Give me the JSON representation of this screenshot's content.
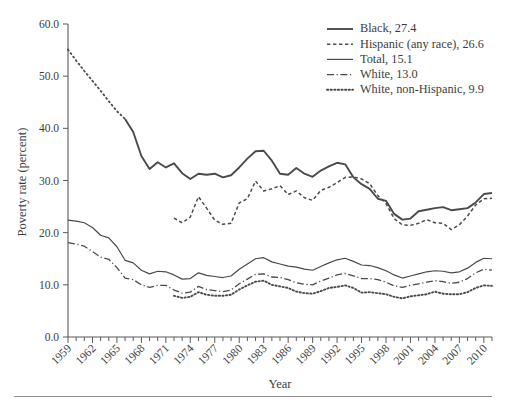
{
  "chart_data": {
    "type": "line",
    "title": "",
    "xlabel": "Year",
    "ylabel": "Poverty rate (percent)",
    "xlim": [
      1959,
      2011
    ],
    "ylim": [
      0,
      60
    ],
    "ytick_step": 10,
    "ytick_labels": [
      "0.0",
      "10.0",
      "20.0",
      "30.0",
      "40.0",
      "50.0",
      "60.0"
    ],
    "ytick_values": [
      0,
      10,
      20,
      30,
      40,
      50,
      60
    ],
    "xtick_labels": [
      "1959",
      "1962",
      "1965",
      "1968",
      "1971",
      "1974",
      "1977",
      "1980",
      "1983",
      "1986",
      "1989",
      "1992",
      "1995",
      "1998",
      "2001",
      "2004",
      "2007",
      "2010"
    ],
    "xtick_values": [
      1959,
      1962,
      1965,
      1968,
      1971,
      1974,
      1977,
      1980,
      1983,
      1986,
      1989,
      1992,
      1995,
      1998,
      2001,
      2004,
      2007,
      2010
    ],
    "minor_ticks": "every year",
    "grid": false,
    "legend_position": "top-right",
    "line_color": "#4a4a4a",
    "series": [
      {
        "name": "Black",
        "legend_label": "Black, 27.4",
        "last_value": 27.4,
        "style": "solid",
        "x": [
          1959,
          1960,
          1961,
          1962,
          1963,
          1964,
          1965,
          1966,
          1967,
          1968,
          1969,
          1970,
          1971,
          1972,
          1973,
          1974,
          1975,
          1976,
          1977,
          1978,
          1979,
          1980,
          1981,
          1982,
          1983,
          1984,
          1985,
          1986,
          1987,
          1988,
          1989,
          1990,
          1991,
          1992,
          1993,
          1994,
          1995,
          1996,
          1997,
          1998,
          1999,
          2000,
          2001,
          2002,
          2003,
          2004,
          2005,
          2006,
          2007,
          2008,
          2009,
          2010,
          2011
        ],
        "values": [
          55.1,
          53.0,
          51.0,
          49.1,
          47.2,
          45.2,
          43.3,
          41.8,
          39.3,
          34.7,
          32.2,
          33.5,
          32.5,
          33.3,
          31.4,
          30.3,
          31.3,
          31.1,
          31.3,
          30.6,
          31.0,
          32.5,
          34.2,
          35.6,
          35.7,
          33.8,
          31.3,
          31.1,
          32.4,
          31.3,
          30.7,
          31.9,
          32.7,
          33.4,
          33.1,
          30.6,
          29.3,
          28.4,
          26.5,
          26.1,
          23.6,
          22.5,
          22.7,
          24.1,
          24.4,
          24.7,
          24.9,
          24.3,
          24.5,
          24.7,
          25.8,
          27.4,
          27.6
        ]
      },
      {
        "name": "Hispanic (any race)",
        "legend_label": "Hispanic (any race), 26.6",
        "last_value": 26.6,
        "style": "dashed",
        "x": [
          1972,
          1973,
          1974,
          1975,
          1976,
          1977,
          1978,
          1979,
          1980,
          1981,
          1982,
          1983,
          1984,
          1985,
          1986,
          1987,
          1988,
          1989,
          1990,
          1991,
          1992,
          1993,
          1994,
          1995,
          1996,
          1997,
          1998,
          1999,
          2000,
          2001,
          2002,
          2003,
          2004,
          2005,
          2006,
          2007,
          2008,
          2009,
          2010,
          2011
        ],
        "values": [
          22.8,
          21.9,
          23.0,
          26.9,
          24.7,
          22.4,
          21.6,
          21.8,
          25.7,
          26.5,
          29.9,
          28.0,
          28.4,
          29.0,
          27.3,
          28.0,
          26.7,
          26.2,
          28.1,
          28.7,
          29.6,
          30.6,
          30.7,
          30.3,
          29.4,
          27.1,
          25.6,
          22.7,
          21.5,
          21.4,
          21.8,
          22.5,
          21.9,
          21.8,
          20.6,
          21.5,
          23.2,
          25.3,
          26.5,
          26.6
        ]
      },
      {
        "name": "Total",
        "legend_label": "Total, 15.1",
        "last_value": 15.1,
        "style": "solid-thin",
        "x": [
          1959,
          1960,
          1961,
          1962,
          1963,
          1964,
          1965,
          1966,
          1967,
          1968,
          1969,
          1970,
          1971,
          1972,
          1973,
          1974,
          1975,
          1976,
          1977,
          1978,
          1979,
          1980,
          1981,
          1982,
          1983,
          1984,
          1985,
          1986,
          1987,
          1988,
          1989,
          1990,
          1991,
          1992,
          1993,
          1994,
          1995,
          1996,
          1997,
          1998,
          1999,
          2000,
          2001,
          2002,
          2003,
          2004,
          2005,
          2006,
          2007,
          2008,
          2009,
          2010,
          2011
        ],
        "values": [
          22.4,
          22.2,
          21.9,
          21.0,
          19.5,
          19.0,
          17.3,
          14.7,
          14.2,
          12.8,
          12.1,
          12.6,
          12.5,
          11.9,
          11.1,
          11.2,
          12.3,
          11.8,
          11.6,
          11.4,
          11.7,
          13.0,
          14.0,
          15.0,
          15.2,
          14.4,
          14.0,
          13.6,
          13.4,
          13.0,
          12.8,
          13.5,
          14.2,
          14.8,
          15.1,
          14.5,
          13.8,
          13.7,
          13.3,
          12.7,
          11.9,
          11.3,
          11.7,
          12.1,
          12.5,
          12.7,
          12.6,
          12.3,
          12.5,
          13.2,
          14.3,
          15.1,
          15.0
        ]
      },
      {
        "name": "White",
        "legend_label": "White, 13.0",
        "last_value": 13.0,
        "style": "dash-dot",
        "x": [
          1959,
          1960,
          1961,
          1962,
          1963,
          1964,
          1965,
          1966,
          1967,
          1968,
          1969,
          1970,
          1971,
          1972,
          1973,
          1974,
          1975,
          1976,
          1977,
          1978,
          1979,
          1980,
          1981,
          1982,
          1983,
          1984,
          1985,
          1986,
          1987,
          1988,
          1989,
          1990,
          1991,
          1992,
          1993,
          1994,
          1995,
          1996,
          1997,
          1998,
          1999,
          2000,
          2001,
          2002,
          2003,
          2004,
          2005,
          2006,
          2007,
          2008,
          2009,
          2010,
          2011
        ],
        "values": [
          18.1,
          17.8,
          17.4,
          16.4,
          15.3,
          14.9,
          13.3,
          11.3,
          11.0,
          10.0,
          9.5,
          9.9,
          9.9,
          9.0,
          8.4,
          8.6,
          9.7,
          9.1,
          8.9,
          8.7,
          9.0,
          10.2,
          11.1,
          12.0,
          12.1,
          11.5,
          11.4,
          11.0,
          10.4,
          10.1,
          10.0,
          10.7,
          11.3,
          11.9,
          12.2,
          11.7,
          11.2,
          11.2,
          11.0,
          10.5,
          9.8,
          9.5,
          9.9,
          10.2,
          10.5,
          10.8,
          10.6,
          10.3,
          10.5,
          11.2,
          12.3,
          13.0,
          12.8
        ]
      },
      {
        "name": "White, non-Hispanic",
        "legend_label": "White, non-Hispanic, 9.9",
        "last_value": 9.9,
        "style": "dotted",
        "x": [
          1972,
          1973,
          1974,
          1975,
          1976,
          1977,
          1978,
          1979,
          1980,
          1981,
          1982,
          1983,
          1984,
          1985,
          1986,
          1987,
          1988,
          1989,
          1990,
          1991,
          1992,
          1993,
          1994,
          1995,
          1996,
          1997,
          1998,
          1999,
          2000,
          2001,
          2002,
          2003,
          2004,
          2005,
          2006,
          2007,
          2008,
          2009,
          2010,
          2011
        ],
        "values": [
          7.9,
          7.5,
          7.7,
          8.6,
          8.1,
          7.9,
          7.9,
          8.1,
          9.1,
          9.9,
          10.6,
          10.8,
          10.0,
          9.7,
          9.4,
          8.7,
          8.4,
          8.3,
          8.8,
          9.4,
          9.6,
          9.9,
          9.4,
          8.5,
          8.6,
          8.4,
          8.2,
          7.7,
          7.4,
          7.8,
          8.0,
          8.2,
          8.7,
          8.3,
          8.2,
          8.2,
          8.6,
          9.4,
          9.9,
          9.8
        ]
      }
    ]
  },
  "axes": {
    "ylabel": "Poverty rate (percent)",
    "xlabel": "Year"
  },
  "legend": {
    "items": [
      {
        "label": "Black, 27.4",
        "style": "solid"
      },
      {
        "label": "Hispanic (any race), 26.6",
        "style": "dashed"
      },
      {
        "label": "Total, 15.1",
        "style": "solid-thin"
      },
      {
        "label": "White, 13.0",
        "style": "dash-dot"
      },
      {
        "label": "White, non-Hispanic, 9.9",
        "style": "dotted"
      }
    ]
  }
}
